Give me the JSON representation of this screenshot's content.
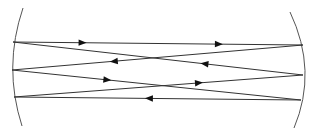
{
  "diagram": {
    "title": "",
    "type": "multipass optical cavity (Herriott-type) ray diagram",
    "colors": {
      "line": "#333333",
      "mirror": "#555555",
      "background": "#ffffff"
    },
    "mirrors": [
      {
        "id": "left-mirror",
        "path": "M23,8 Q3,67 22,126"
      },
      {
        "id": "right-mirror",
        "path": "M290,12 Q318,71 294,128"
      }
    ],
    "rays": [
      {
        "id": "ray-1",
        "from": [
          13,
          42
        ],
        "to": [
          303,
          45
        ],
        "arrows": [
          0.24,
          0.71
        ]
      },
      {
        "id": "ray-2",
        "from": [
          303,
          75
        ],
        "to": [
          13,
          42
        ],
        "arrows": [
          0.34
        ]
      },
      {
        "id": "ray-3",
        "from": [
          303,
          45
        ],
        "to": [
          12,
          70
        ],
        "arrows": [
          0.65
        ]
      },
      {
        "id": "ray-4",
        "from": [
          12,
          70
        ],
        "to": [
          301,
          100
        ],
        "arrows": [
          0.33
        ]
      },
      {
        "id": "ray-5",
        "from": [
          14,
          97
        ],
        "to": [
          303,
          75
        ],
        "arrows": [
          0.64
        ]
      },
      {
        "id": "ray-6",
        "from": [
          301,
          100
        ],
        "to": [
          14,
          97
        ],
        "arrows": [
          0.53
        ]
      }
    ]
  }
}
